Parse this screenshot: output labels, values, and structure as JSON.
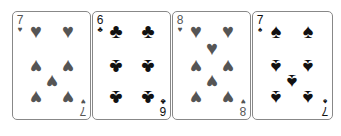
{
  "cards": [
    {
      "rank": "7",
      "suit": "hearts",
      "glyph": "♥",
      "color": "#555555",
      "pips": [
        [
          23,
          19,
          0
        ],
        [
          55,
          19,
          0
        ],
        [
          23,
          55,
          1
        ],
        [
          55,
          55,
          1
        ],
        [
          39,
          70,
          1
        ],
        [
          23,
          86,
          1
        ],
        [
          55,
          86,
          1
        ]
      ]
    },
    {
      "rank": "6",
      "suit": "clubs",
      "glyph": "♣",
      "color": "#111111",
      "pips": [
        [
          23,
          19,
          0
        ],
        [
          55,
          19,
          0
        ],
        [
          23,
          55,
          1
        ],
        [
          55,
          55,
          1
        ],
        [
          23,
          86,
          1
        ],
        [
          55,
          86,
          1
        ]
      ]
    },
    {
      "rank": "8",
      "suit": "hearts",
      "glyph": "♥",
      "color": "#555555",
      "pips": [
        [
          23,
          19,
          0
        ],
        [
          55,
          19,
          0
        ],
        [
          39,
          36,
          0
        ],
        [
          23,
          55,
          1
        ],
        [
          55,
          55,
          1
        ],
        [
          39,
          70,
          1
        ],
        [
          23,
          86,
          1
        ],
        [
          55,
          86,
          1
        ]
      ]
    },
    {
      "rank": "7",
      "suit": "spades",
      "glyph": "♠",
      "color": "#111111",
      "pips": [
        [
          23,
          19,
          0
        ],
        [
          55,
          19,
          0
        ],
        [
          23,
          55,
          1
        ],
        [
          55,
          55,
          1
        ],
        [
          39,
          70,
          1
        ],
        [
          23,
          86,
          1
        ],
        [
          55,
          86,
          1
        ]
      ]
    }
  ]
}
